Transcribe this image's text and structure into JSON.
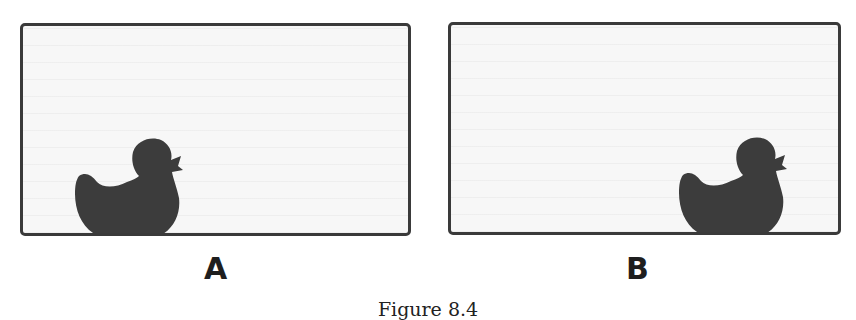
{
  "figure": {
    "caption": "Figure 8.4",
    "panels": [
      {
        "id": "A",
        "label": "A",
        "subject": "duck-silhouette",
        "subject_position": "bottom-left-center"
      },
      {
        "id": "B",
        "label": "B",
        "subject": "duck-silhouette",
        "subject_position": "bottom-right"
      }
    ]
  },
  "colors": {
    "frame_border": "#3a3a3a",
    "frame_fill": "#f7f7f7",
    "silhouette": "#3c3c3c",
    "label_text": "#1e1e1e"
  }
}
